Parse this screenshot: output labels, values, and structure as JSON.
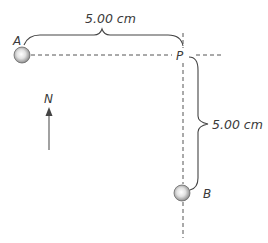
{
  "diagram": {
    "points": {
      "A": {
        "label": "A"
      },
      "P": {
        "label": "P"
      },
      "B": {
        "label": "B"
      }
    },
    "dimensions": {
      "horizontal": {
        "label": "5.00 cm",
        "from": "A",
        "to": "P"
      },
      "vertical": {
        "label": "5.00 cm",
        "from": "P",
        "to": "B"
      }
    },
    "compass": {
      "label": "N",
      "icon": "north-arrow-icon"
    },
    "objects": [
      {
        "name": "ball-a",
        "at": "A",
        "icon": "sphere-icon"
      },
      {
        "name": "ball-b",
        "at": "B",
        "icon": "sphere-icon"
      }
    ],
    "colors": {
      "line": "#555555",
      "text": "#3a3a3a",
      "sphere_center": "#ffffff",
      "sphere_rim": "#7a7a7a"
    }
  }
}
